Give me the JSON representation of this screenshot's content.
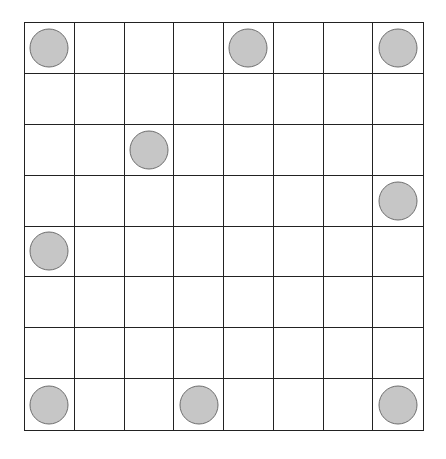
{
  "diagram": {
    "type": "grid-board",
    "rows": 8,
    "cols": 8,
    "colors": {
      "background": "#ffffff",
      "grid_line": "#222222",
      "token_fill": "#c6c6c6",
      "token_border": "#6e6e6e"
    },
    "tokens": [
      {
        "row": 0,
        "col": 0,
        "shape": "circle"
      },
      {
        "row": 0,
        "col": 4,
        "shape": "circle"
      },
      {
        "row": 0,
        "col": 7,
        "shape": "circle"
      },
      {
        "row": 2,
        "col": 2,
        "shape": "circle"
      },
      {
        "row": 3,
        "col": 7,
        "shape": "circle"
      },
      {
        "row": 4,
        "col": 0,
        "shape": "circle"
      },
      {
        "row": 7,
        "col": 0,
        "shape": "circle"
      },
      {
        "row": 7,
        "col": 3,
        "shape": "circle"
      },
      {
        "row": 7,
        "col": 7,
        "shape": "circle"
      }
    ]
  }
}
